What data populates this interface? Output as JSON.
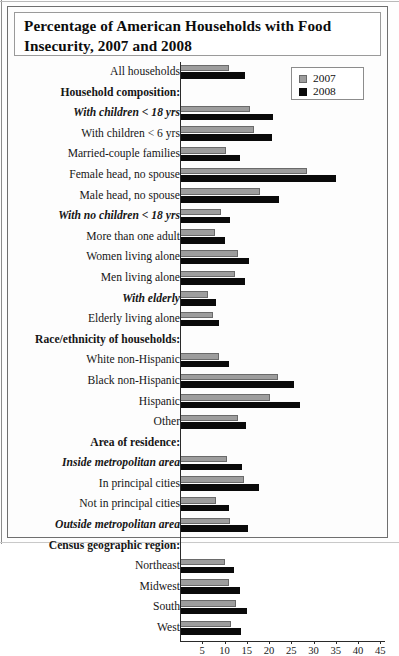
{
  "figure": {
    "title": "Percentage of American Households with Food Insecurity, 2007 and 2008"
  },
  "legend": {
    "items": [
      {
        "label": "2007",
        "color": "#9d9d9d"
      },
      {
        "label": "2008",
        "color": "#0a0a0a"
      }
    ]
  },
  "chart_data": {
    "type": "bar",
    "orientation": "horizontal",
    "title": "Percentage of American Households with Food Insecurity, 2007 and 2008",
    "xlabel": "",
    "ylabel": "",
    "xlim": [
      0,
      46
    ],
    "xticks": [
      5,
      10,
      15,
      20,
      25,
      30,
      35,
      40,
      45
    ],
    "grid": false,
    "legend_position": "top-right",
    "categories": [
      "All households",
      "Household composition:",
      "With children < 18 yrs",
      "With children < 6 yrs",
      "Married-couple families",
      "Female head, no spouse",
      "Male head, no spouse",
      "With no children < 18 yrs",
      "More than one adult",
      "Women living alone",
      "Men living alone",
      "With elderly",
      "Elderly living alone",
      "Race/ethnicity of households:",
      "White non-Hispanic",
      "Black non-Hispanic",
      "Hispanic",
      "Other",
      "Area of residence:",
      "Inside metropolitan area",
      "In principal cities",
      "Not in principal cities",
      "Outside metropolitan area",
      "Census geographic region:",
      "Northeast",
      "Midwest",
      "South",
      "West"
    ],
    "category_styles": [
      "plain",
      "header",
      "subheader",
      "plain",
      "plain",
      "plain",
      "plain",
      "subheader",
      "plain",
      "plain",
      "plain",
      "subheader",
      "plain",
      "header",
      "plain",
      "plain",
      "plain",
      "plain",
      "header",
      "subheader",
      "plain",
      "plain",
      "subheader",
      "header",
      "plain",
      "plain",
      "plain",
      "plain"
    ],
    "series": [
      {
        "name": "2007",
        "color": "#9d9d9d",
        "values": [
          11.1,
          null,
          15.8,
          16.6,
          10.4,
          28.5,
          17.9,
          9.2,
          7.8,
          13.1,
          12.4,
          6.3,
          7.5,
          null,
          8.7,
          22.0,
          20.2,
          13.0,
          null,
          10.6,
          14.4,
          8.2,
          11.2,
          null,
          10.0,
          11.0,
          12.5,
          11.4
        ]
      },
      {
        "name": "2008",
        "color": "#0a0a0a",
        "values": [
          14.6,
          null,
          21.0,
          20.7,
          13.5,
          35.0,
          22.2,
          11.3,
          10.0,
          15.5,
          14.7,
          8.2,
          8.7,
          null,
          11.1,
          25.7,
          26.9,
          14.9,
          null,
          14.0,
          17.7,
          11.1,
          15.2,
          null,
          12.2,
          13.4,
          15.0,
          13.6
        ]
      }
    ]
  }
}
